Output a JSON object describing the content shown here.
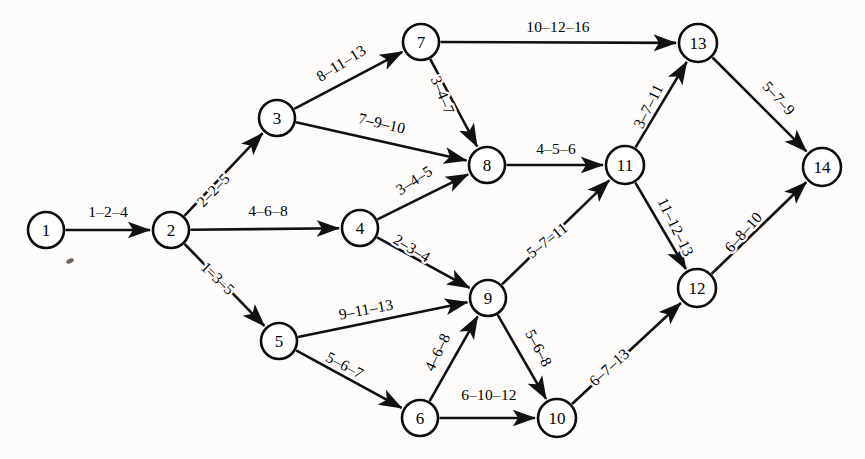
{
  "figure": {
    "kind": "activity-network-diagram",
    "background_color": "#fdfcfa",
    "ink_color": "#111111",
    "node_fill": "#ffffff"
  },
  "nodes": [
    {
      "id": "1",
      "label": "1",
      "x": 46,
      "y": 230,
      "r": 18
    },
    {
      "id": "2",
      "label": "2",
      "x": 171,
      "y": 230,
      "r": 18
    },
    {
      "id": "3",
      "label": "3",
      "x": 277,
      "y": 118,
      "r": 18
    },
    {
      "id": "4",
      "label": "4",
      "x": 360,
      "y": 228,
      "r": 18
    },
    {
      "id": "5",
      "label": "5",
      "x": 279,
      "y": 341,
      "r": 18
    },
    {
      "id": "6",
      "label": "6",
      "x": 420,
      "y": 418,
      "r": 18
    },
    {
      "id": "7",
      "label": "7",
      "x": 421,
      "y": 42,
      "r": 18
    },
    {
      "id": "8",
      "label": "8",
      "x": 487,
      "y": 165,
      "r": 18
    },
    {
      "id": "9",
      "label": "9",
      "x": 488,
      "y": 298,
      "r": 18
    },
    {
      "id": "10",
      "label": "10",
      "x": 557,
      "y": 418,
      "r": 19
    },
    {
      "id": "11",
      "label": "11",
      "x": 625,
      "y": 165,
      "r": 19
    },
    {
      "id": "12",
      "label": "12",
      "x": 697,
      "y": 288,
      "r": 19
    },
    {
      "id": "13",
      "label": "13",
      "x": 698,
      "y": 43,
      "r": 19
    },
    {
      "id": "14",
      "label": "14",
      "x": 822,
      "y": 167,
      "r": 19
    }
  ],
  "edges": [
    {
      "from": "1",
      "to": "2",
      "label": "1–2–4",
      "lx": 108,
      "ly": 211,
      "rot": 0,
      "weights": [
        1,
        2,
        4
      ]
    },
    {
      "from": "2",
      "to": "3",
      "label": "2–2–5",
      "lx": 213,
      "ly": 190,
      "rot": -46,
      "weights": [
        2,
        2,
        5
      ]
    },
    {
      "from": "2",
      "to": "4",
      "label": "4–6–8",
      "lx": 268,
      "ly": 210,
      "rot": 0,
      "weights": [
        4,
        6,
        8
      ]
    },
    {
      "from": "2",
      "to": "5",
      "label": "1–3–5",
      "lx": 218,
      "ly": 278,
      "rot": 44,
      "weights": [
        1,
        3,
        5
      ]
    },
    {
      "from": "3",
      "to": "7",
      "label": "8–11–13",
      "lx": 341,
      "ly": 63,
      "rot": -32,
      "weights": [
        8,
        11,
        13
      ]
    },
    {
      "from": "3",
      "to": "8",
      "label": "7–9–10",
      "lx": 382,
      "ly": 123,
      "rot": 13,
      "weights": [
        7,
        9,
        10
      ]
    },
    {
      "from": "4",
      "to": "8",
      "label": "3–4–5",
      "lx": 414,
      "ly": 180,
      "rot": -33,
      "weights": [
        3,
        4,
        5
      ]
    },
    {
      "from": "4",
      "to": "9",
      "label": "2–3–4",
      "lx": 412,
      "ly": 248,
      "rot": 31,
      "weights": [
        2,
        3,
        4
      ]
    },
    {
      "from": "5",
      "to": "9",
      "label": "9–11–13",
      "lx": 366,
      "ly": 309,
      "rot": -11,
      "weights": [
        9,
        11,
        13
      ]
    },
    {
      "from": "5",
      "to": "6",
      "label": "5–6–7",
      "lx": 345,
      "ly": 365,
      "rot": 28,
      "weights": [
        5,
        6,
        7
      ]
    },
    {
      "from": "6",
      "to": "9",
      "label": "4–6–8",
      "lx": 437,
      "ly": 352,
      "rot": -64,
      "weights": [
        4,
        6,
        8
      ]
    },
    {
      "from": "6",
      "to": "10",
      "label": "6–10–12",
      "lx": 489,
      "ly": 394,
      "rot": 0,
      "weights": [
        6,
        10,
        12
      ]
    },
    {
      "from": "7",
      "to": "8",
      "label": "3–4–7",
      "lx": 443,
      "ly": 95,
      "rot": 68,
      "weights": [
        3,
        4,
        7
      ]
    },
    {
      "from": "7",
      "to": "13",
      "label": "10–12–16",
      "lx": 558,
      "ly": 26,
      "rot": 0,
      "weights": [
        10,
        12,
        16
      ]
    },
    {
      "from": "8",
      "to": "11",
      "label": "4–5–6",
      "lx": 556,
      "ly": 148,
      "rot": 0,
      "weights": [
        4,
        5,
        6
      ]
    },
    {
      "from": "9",
      "to": "11",
      "label": "5–7–11",
      "lx": 547,
      "ly": 240,
      "rot": -38,
      "weights": [
        5,
        7,
        11
      ]
    },
    {
      "from": "9",
      "to": "10",
      "label": "5–6–8",
      "lx": 539,
      "ly": 348,
      "rot": 62,
      "weights": [
        5,
        6,
        8
      ]
    },
    {
      "from": "10",
      "to": "12",
      "label": "6–7–13",
      "lx": 609,
      "ly": 367,
      "rot": -42,
      "weights": [
        6,
        7,
        13
      ]
    },
    {
      "from": "11",
      "to": "13",
      "label": "3–7–11",
      "lx": 648,
      "ly": 106,
      "rot": -63,
      "weights": [
        3,
        7,
        11
      ]
    },
    {
      "from": "11",
      "to": "12",
      "label": "11–12–13",
      "lx": 676,
      "ly": 227,
      "rot": 64,
      "weights": [
        11,
        12,
        13
      ]
    },
    {
      "from": "12",
      "to": "14",
      "label": "6–8–10",
      "lx": 743,
      "ly": 232,
      "rot": -48,
      "weights": [
        6,
        8,
        10
      ]
    },
    {
      "from": "13",
      "to": "14",
      "label": "5–7–9",
      "lx": 779,
      "ly": 98,
      "rot": 48,
      "weights": [
        5,
        7,
        9
      ]
    }
  ],
  "marks": [
    {
      "name": "paper-speck",
      "x": 70,
      "y": 261,
      "rx": 4,
      "ry": 2.2,
      "rot": -25
    }
  ]
}
